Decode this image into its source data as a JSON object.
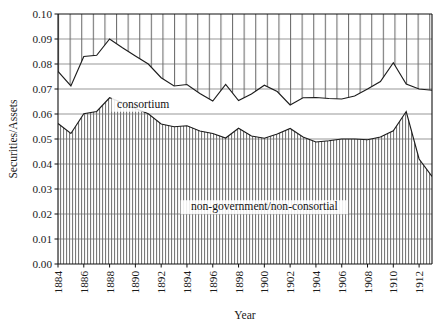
{
  "chart_data": {
    "type": "area",
    "title": "",
    "xlabel": "Year",
    "ylabel": "Securities/Assets",
    "stacked": true,
    "grid": true,
    "legend_position": "inline-annotations",
    "xlim": [
      1884,
      1913
    ],
    "ylim": [
      0.0,
      0.1
    ],
    "ytick_labels": [
      "0.00",
      "0.01",
      "0.02",
      "0.03",
      "0.04",
      "0.05",
      "0.06",
      "0.07",
      "0.08",
      "0.09",
      "0.10"
    ],
    "ytick_values": [
      0.0,
      0.01,
      0.02,
      0.03,
      0.04,
      0.05,
      0.06,
      0.07,
      0.08,
      0.09,
      0.1
    ],
    "xtick_labels": [
      "1884",
      "1886",
      "1888",
      "1890",
      "1892",
      "1894",
      "1896",
      "1898",
      "1900",
      "1902",
      "1904",
      "1906",
      "1908",
      "1910",
      "1912"
    ],
    "xtick_values": [
      1884,
      1886,
      1888,
      1890,
      1892,
      1894,
      1896,
      1898,
      1900,
      1902,
      1904,
      1906,
      1908,
      1910,
      1912
    ],
    "x": [
      1884,
      1885,
      1886,
      1887,
      1888,
      1889,
      1890,
      1891,
      1892,
      1893,
      1894,
      1895,
      1896,
      1897,
      1898,
      1899,
      1900,
      1901,
      1902,
      1903,
      1904,
      1905,
      1906,
      1907,
      1908,
      1909,
      1910,
      1911,
      1912,
      1913
    ],
    "series": [
      {
        "name": "non-government/non-consortial",
        "annotation": "non-government/non-consortial",
        "fill": "dense-vertical-hatch",
        "values": [
          0.0562,
          0.0522,
          0.0601,
          0.061,
          0.0665,
          0.0645,
          0.0622,
          0.0601,
          0.056,
          0.0549,
          0.0553,
          0.0532,
          0.0522,
          0.0504,
          0.0543,
          0.0512,
          0.0503,
          0.052,
          0.0542,
          0.0508,
          0.0488,
          0.0493,
          0.05,
          0.05,
          0.0497,
          0.0508,
          0.0533,
          0.061,
          0.042,
          0.035
        ]
      },
      {
        "name": "consortium",
        "annotation": "consortium",
        "fill": "sparse-vertical-hatch",
        "values": [
          0.077,
          0.0712,
          0.083,
          0.0835,
          0.09,
          0.0865,
          0.0832,
          0.08,
          0.0745,
          0.0712,
          0.0718,
          0.0682,
          0.0652,
          0.0718,
          0.0654,
          0.068,
          0.0715,
          0.069,
          0.0636,
          0.0665,
          0.0666,
          0.0662,
          0.066,
          0.0672,
          0.07,
          0.073,
          0.0805,
          0.072,
          0.07,
          0.0695
        ]
      }
    ],
    "annotations": [
      {
        "text": "consortium",
        "x": 1890.6,
        "y": 0.0625
      },
      {
        "text": "non-government/non-consortial",
        "x": 1900.0,
        "y": 0.0215
      }
    ]
  }
}
